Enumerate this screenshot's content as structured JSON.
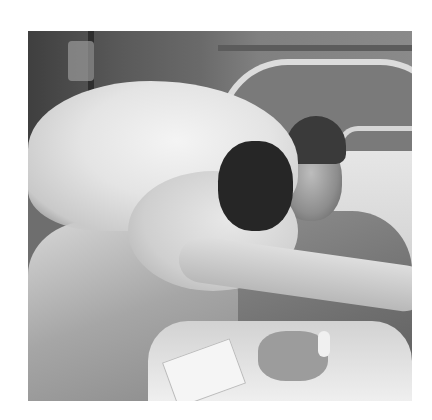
{
  "image": {
    "description": "Black-and-white photograph of a bride in a lace wedding dress and veil embracing a smiling man in a cap lying in a hospital bed",
    "palette": {
      "background": "#ffffff",
      "dark": "#2e2e2e",
      "mid": "#7a7a7a",
      "light": "#e8e8e8"
    },
    "subjects": [
      {
        "name": "bride",
        "features": [
          "veil",
          "lace dress",
          "long lace sleeves"
        ]
      },
      {
        "name": "man",
        "features": [
          "cap",
          "shirt",
          "hospital wristband"
        ]
      }
    ],
    "setting": [
      "hospital bed",
      "IV pole",
      "pillow",
      "blanket",
      "card"
    ]
  }
}
